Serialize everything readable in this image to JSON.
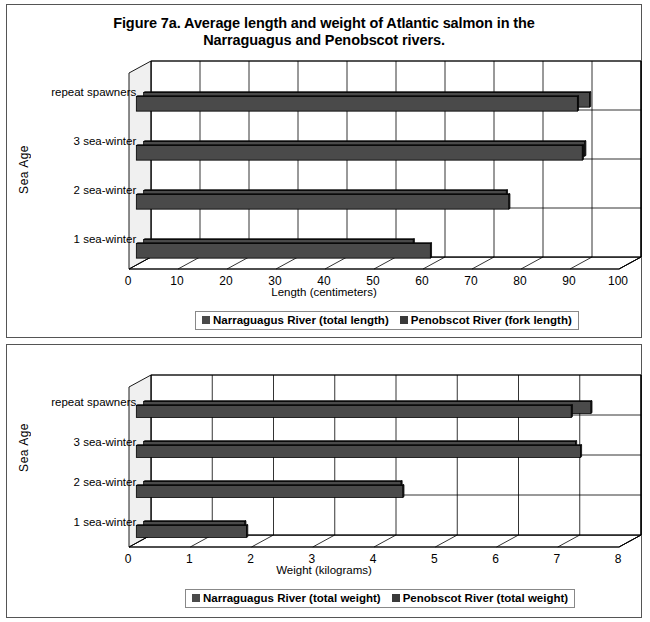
{
  "figure": {
    "title_line1": "Figure 7a. Average length and weight of Atlantic salmon in the",
    "title_line2": "Narraguagus and Penobscot rivers."
  },
  "colors": {
    "bar_front": "#4a4a4a",
    "bar_top": "#565656",
    "bar_side": "#2e2e2e",
    "floor": "#ffffff",
    "wall": "#ffffff",
    "grid": "#000000",
    "frame": "#555555",
    "legend_border": "#888888",
    "series1_swatch": "#4a4a4a",
    "series2_swatch": "#3a3a3a"
  },
  "panels": [
    {
      "id": "length",
      "y_axis_title": "Sea Age",
      "x_axis_title": "Length (centimeters)",
      "legend": [
        "Narraguagus River (total length)",
        "Penobscot River (fork length)"
      ]
    },
    {
      "id": "weight",
      "y_axis_title": "Sea Age",
      "x_axis_title": "Weight (kilograms)",
      "legend": [
        "Narraguagus River (total weight)",
        "Penobscot River (total weight)"
      ]
    }
  ],
  "chart_data": [
    {
      "type": "bar",
      "orientation": "horizontal",
      "three_d": true,
      "title": "Figure 7a. Average length and weight of Atlantic salmon in the Narraguagus and Penobscot rivers.",
      "subtitle": "",
      "xlabel": "Length (centimeters)",
      "ylabel": "Sea Age",
      "categories": [
        "1 sea-winter",
        "2 sea-winter",
        "3 sea-winter",
        "repeat spawners"
      ],
      "tick_labels": [
        "0",
        "10",
        "20",
        "30",
        "40",
        "50",
        "60",
        "70",
        "80",
        "90",
        "100"
      ],
      "xlim": [
        0,
        100
      ],
      "xtick_step": 10,
      "grid": true,
      "legend_position": "below",
      "series": [
        {
          "name": "Narraguagus River (total length)",
          "values": [
            55,
            74,
            90,
            91
          ]
        },
        {
          "name": "Penobscot River (fork length)",
          "values": [
            60,
            76,
            91,
            90
          ]
        }
      ]
    },
    {
      "type": "bar",
      "orientation": "horizontal",
      "three_d": true,
      "title": "",
      "xlabel": "Weight (kilograms)",
      "ylabel": "Sea Age",
      "categories": [
        "1 sea-winter",
        "2 sea-winter",
        "3 sea-winter",
        "repeat spawners"
      ],
      "tick_labels": [
        "0",
        "1",
        "2",
        "3",
        "4",
        "5",
        "6",
        "7",
        "8"
      ],
      "xlim": [
        0,
        8
      ],
      "xtick_step": 1,
      "grid": true,
      "legend_position": "below",
      "series": [
        {
          "name": "Narraguagus River (total weight)",
          "values": [
            1.65,
            4.2,
            7.05,
            7.3
          ]
        },
        {
          "name": "Penobscot River (total weight)",
          "values": [
            1.8,
            4.35,
            7.25,
            7.1
          ]
        }
      ]
    }
  ]
}
